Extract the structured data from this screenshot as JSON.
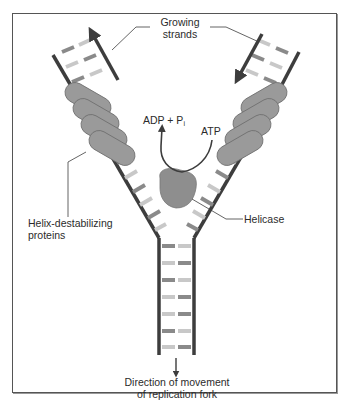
{
  "figure": {
    "labels": {
      "growing_strands_line1": "Growing",
      "growing_strands_line2": "strands",
      "adp_pi_main": "ADP + P",
      "adp_pi_sub": "i",
      "atp": "ATP",
      "helix_destab_line1": "Helix-destabilizing",
      "helix_destab_line2": "proteins",
      "helicase": "Helicase",
      "direction_line1": "Direction of movement",
      "direction_line2": "of replication fork"
    },
    "colors": {
      "backbone": "#3d3d3d",
      "base_dark": "#8a8a8a",
      "base_light": "#c8c8c8",
      "protein_fill": "#9a9a9a",
      "protein_stroke": "#6e6e6e",
      "helicase_fill": "#8e8e8e",
      "text": "#2b2b2b",
      "frame": "#555555"
    },
    "components": [
      "growing-strand-left",
      "growing-strand-right",
      "helix-destabilizing-proteins-left",
      "helix-destabilizing-proteins-right",
      "helicase",
      "atp-hydrolysis-arrow",
      "parental-duplex",
      "fork-direction-arrow"
    ]
  }
}
